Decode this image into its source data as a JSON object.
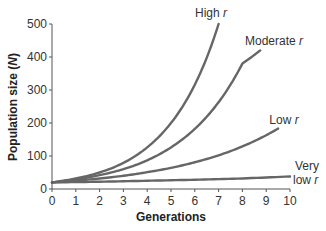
{
  "chart_data": {
    "type": "line",
    "title": "",
    "xlabel": "Generations",
    "ylabel": "Population size (N)",
    "ylabel_parts": {
      "main": "Population size (",
      "italic": "N",
      "end": ")"
    },
    "xlim": [
      0,
      10
    ],
    "ylim": [
      0,
      500
    ],
    "x_ticks": [
      0,
      1,
      2,
      3,
      4,
      5,
      6,
      7,
      8,
      9,
      10
    ],
    "y_ticks": [
      0,
      100,
      200,
      300,
      400,
      500
    ],
    "grid": false,
    "legend": "inline labels at curve ends",
    "line_color": "#666666",
    "series": [
      {
        "name": "High r",
        "label_main": "High ",
        "label_italic": "r",
        "x": [
          0,
          1,
          2,
          3,
          4,
          5,
          6,
          7
        ],
        "values": [
          20,
          32,
          50,
          79,
          126,
          200,
          316,
          500
        ]
      },
      {
        "name": "Moderate r",
        "label_main": "Moderate ",
        "label_italic": "r",
        "x": [
          0,
          1,
          2,
          3,
          4,
          5,
          6,
          7,
          8,
          8.75
        ],
        "values": [
          20,
          29,
          42,
          60,
          87,
          126,
          182,
          263,
          380,
          420
        ]
      },
      {
        "name": "Low r",
        "label_main": "Low ",
        "label_italic": "r",
        "x": [
          0,
          1,
          2,
          3,
          4,
          5,
          6,
          7,
          8,
          9,
          9.5
        ],
        "values": [
          20,
          25,
          32,
          40,
          51,
          64,
          81,
          102,
          129,
          163,
          183
        ]
      },
      {
        "name": "Very low r",
        "label_main": "Very",
        "label_line2_main": "low ",
        "label_italic": "r",
        "x": [
          0,
          2,
          4,
          6,
          8,
          10
        ],
        "values": [
          20,
          22,
          25,
          28,
          32,
          38
        ]
      }
    ]
  }
}
